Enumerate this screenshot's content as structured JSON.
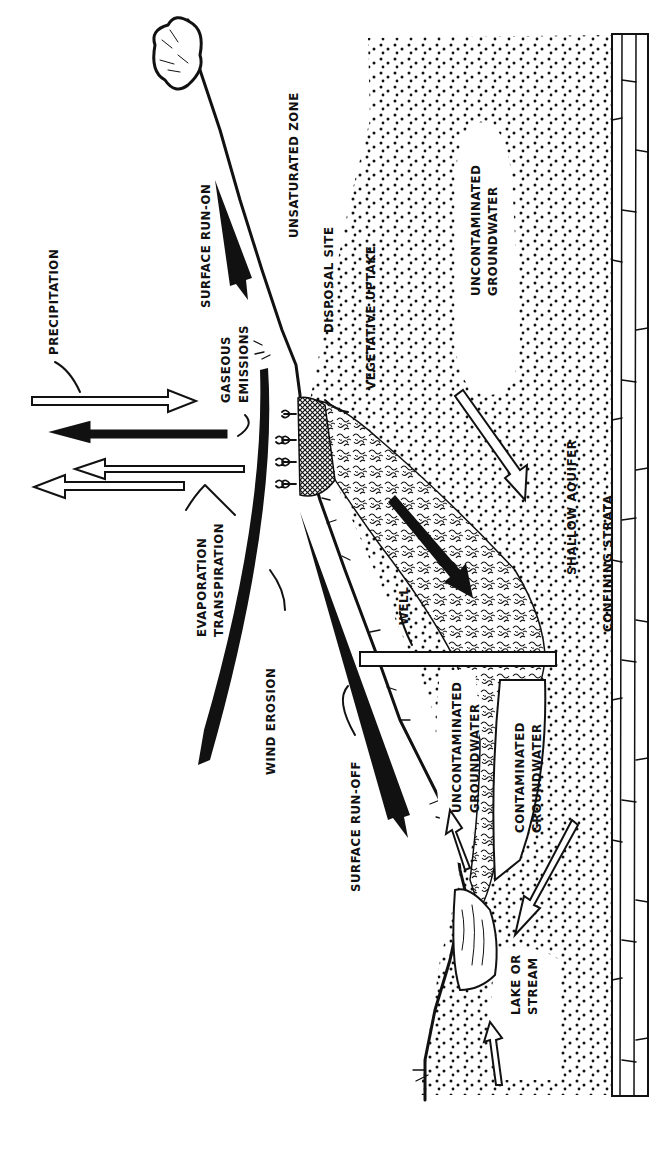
{
  "figure": {
    "orientation": "rotated-90-clockwise",
    "labels": {
      "precipitation": "PRECIPITATION",
      "surface_run_on": "SURFACE RUN-ON",
      "unsaturated_zone": "UNSATURATED ZONE",
      "disposal_site": "DISPOSAL SITE",
      "vegetative_uptake": "VEGETATIVE UPTAKE",
      "gaseous_emissions_1": "GASEOUS",
      "gaseous_emissions_2": "EMISSIONS",
      "uncontaminated_groundwater_top_1": "UNCONTAMINATED",
      "uncontaminated_groundwater_top_2": "GROUNDWATER",
      "evaporation": "EVAPORATION",
      "transpiration": "TRANSPIRATION",
      "wind_erosion": "WIND EROSION",
      "well": "WELL",
      "shallow_aquifer": "SHALLOW AQUIFER",
      "confining_strata": "CONFINING STRATA",
      "surface_run_off": "SURFACE RUN-OFF",
      "uncontaminated_groundwater_low_1": "UNCONTAMINATED",
      "uncontaminated_groundwater_low_2": "GROUNDWATER",
      "contaminated_groundwater_1": "CONTAMINATED",
      "contaminated_groundwater_2": "GROUNDWATER",
      "lake_or_stream_1": "LAKE OR",
      "lake_or_stream_2": "STREAM"
    },
    "arrows": [
      {
        "name": "precipitation",
        "style": "hollow",
        "direction": "down-into-ground"
      },
      {
        "name": "gaseous-emissions",
        "style": "solid",
        "direction": "up-to-air"
      },
      {
        "name": "evaporation",
        "style": "hollow",
        "direction": "up-to-air"
      },
      {
        "name": "transpiration",
        "style": "hollow",
        "direction": "up-to-air"
      },
      {
        "name": "wind-erosion",
        "style": "solid",
        "direction": "downwind"
      },
      {
        "name": "surface-run-on",
        "style": "solid",
        "direction": "downslope-onto-site"
      },
      {
        "name": "surface-run-off",
        "style": "solid",
        "direction": "downslope-to-lake"
      },
      {
        "name": "leachate-plume-flow",
        "style": "solid",
        "direction": "down-gradient"
      },
      {
        "name": "groundwater-flow",
        "style": "hollow",
        "direction": "down-gradient"
      }
    ]
  }
}
